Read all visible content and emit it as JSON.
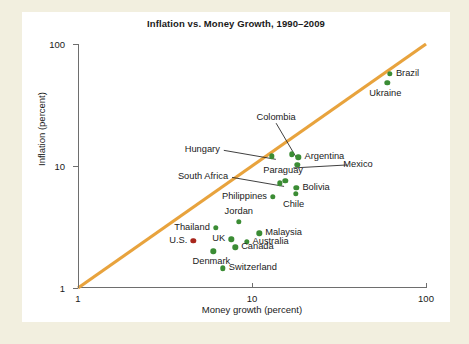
{
  "chart_data": {
    "type": "scatter",
    "title": "Inflation vs. Money Growth, 1990–2009",
    "xlabel": "Money growth (percent)",
    "ylabel": "Inflation (percent)",
    "xscale": "log",
    "yscale": "log",
    "xlim": [
      1,
      100
    ],
    "ylim": [
      1,
      100
    ],
    "xticks": [
      "1",
      "10",
      "100"
    ],
    "yticks": [
      "1",
      "10",
      "100"
    ],
    "grid": false,
    "legend": "none",
    "reference_line": {
      "name": "45-degree line",
      "description": "inflation equals money growth",
      "color": "#e8a33d",
      "from": [
        1,
        1
      ],
      "to": [
        100,
        100
      ]
    },
    "series": [
      {
        "name": "Countries",
        "color": "#3b8c34",
        "points": [
          {
            "label": "Brazil",
            "x": 62.0,
            "y": 57.0,
            "label_pos": "right"
          },
          {
            "label": "Ukraine",
            "x": 60.0,
            "y": 48.0,
            "label_pos": "below-left"
          },
          {
            "label": "Colombia",
            "x": 17.0,
            "y": 12.5,
            "label_pos": "leader-up-left"
          },
          {
            "label": "Argentina",
            "x": 18.5,
            "y": 11.8,
            "label_pos": "right"
          },
          {
            "label": "Mexico",
            "x": 18.2,
            "y": 10.2,
            "label_pos": "leader-right"
          },
          {
            "label": "Hungary",
            "x": 13.0,
            "y": 12.0,
            "label_pos": "leader-left"
          },
          {
            "label": "South Africa",
            "x": 14.5,
            "y": 7.2,
            "label_pos": "leader-left"
          },
          {
            "label": "Paraguay",
            "x": 15.5,
            "y": 7.6,
            "label_pos": "above-left"
          },
          {
            "label": "Bolivia",
            "x": 18.0,
            "y": 6.6,
            "label_pos": "right"
          },
          {
            "label": "Chile",
            "x": 17.8,
            "y": 5.9,
            "label_pos": "below-left"
          },
          {
            "label": "Philippines",
            "x": 13.2,
            "y": 5.6,
            "label_pos": "left"
          },
          {
            "label": "Jordan",
            "x": 8.4,
            "y": 3.5,
            "label_pos": "above"
          },
          {
            "label": "Malaysia",
            "x": 11.0,
            "y": 2.8,
            "label_pos": "right"
          },
          {
            "label": "Thailand",
            "x": 6.2,
            "y": 3.1,
            "label_pos": "left"
          },
          {
            "label": "UK",
            "x": 7.6,
            "y": 2.5,
            "label_pos": "left"
          },
          {
            "label": "Australia",
            "x": 9.3,
            "y": 2.4,
            "label_pos": "right"
          },
          {
            "label": "Canada",
            "x": 8.0,
            "y": 2.15,
            "label_pos": "right"
          },
          {
            "label": "Denmark",
            "x": 6.0,
            "y": 2.0,
            "label_pos": "below-left"
          },
          {
            "label": "Switzerland",
            "x": 6.8,
            "y": 1.45,
            "label_pos": "right"
          }
        ]
      },
      {
        "name": "United States",
        "color": "#a8261c",
        "points": [
          {
            "label": "U.S.",
            "x": 4.6,
            "y": 2.45,
            "label_pos": "left"
          }
        ]
      }
    ]
  }
}
